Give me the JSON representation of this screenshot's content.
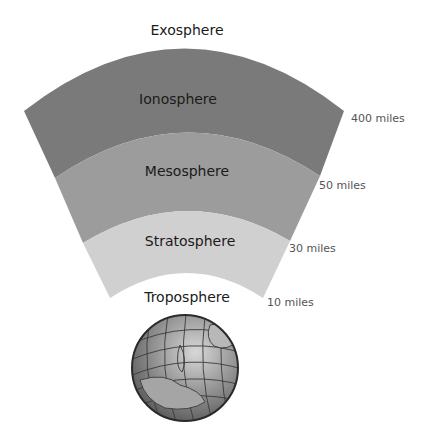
{
  "layers": [
    {
      "name": "Exosphere",
      "altitude": "",
      "color": "#ffffff"
    },
    {
      "name": "Ionosphere",
      "altitude": "400 miles",
      "color": "#7a7a7a"
    },
    {
      "name": "Mesosphere",
      "altitude": "50 miles",
      "color": "#9c9c9c"
    },
    {
      "name": "Stratosphere",
      "altitude": "30 miles",
      "color": "#d0d0d0"
    },
    {
      "name": "Troposphere",
      "altitude": "10 miles",
      "color": "#ffffff"
    }
  ],
  "globe": {
    "label": "Earth",
    "color": "#8f8f8f"
  }
}
